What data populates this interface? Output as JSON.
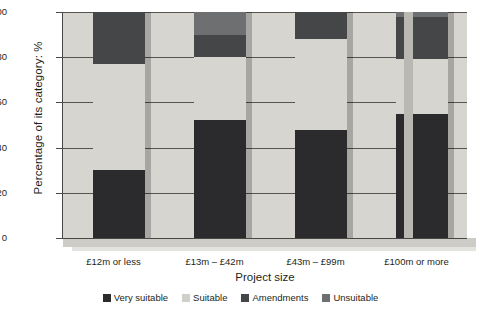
{
  "chart_data": {
    "type": "bar",
    "subtype": "stacked-100-percent",
    "title": "",
    "xlabel": "Project size",
    "ylabel": "Percentage of its category: %",
    "ylim": [
      0,
      100
    ],
    "yticks": [
      0,
      20,
      40,
      60,
      80,
      100
    ],
    "ytick_labels": [
      "0",
      "20",
      "40",
      "60",
      "80",
      "100"
    ],
    "grid": true,
    "legend_position": "bottom",
    "categories": [
      "£12m or less",
      "£13m – £42m",
      "£43m – £99m",
      "£100m or more"
    ],
    "series": [
      {
        "name": "Very suitable",
        "color": "#2b2b2d",
        "values": [
          30,
          52,
          48,
          55
        ]
      },
      {
        "name": "Suitable",
        "color": "#d6d5d0",
        "values": [
          47,
          28,
          40,
          24
        ]
      },
      {
        "name": "Amendments",
        "color": "#454648",
        "values": [
          23,
          10,
          12,
          19
        ]
      },
      {
        "name": "Unsuitable",
        "color": "#6e6f71",
        "values": [
          0,
          10,
          0,
          2
        ]
      }
    ]
  },
  "axes": {
    "y_title": "Percentage of its category: %",
    "x_title": "Project size",
    "y_ticks": [
      "100",
      "80",
      "60",
      "40",
      "20",
      "0"
    ],
    "x_labels": [
      "£12m or less",
      "£13m – £42m",
      "£43m – £99m",
      "£100m or more"
    ]
  },
  "legend": {
    "items": [
      {
        "label": "Very suitable",
        "color": "#2b2b2d"
      },
      {
        "label": "Suitable",
        "color": "#d0cfca"
      },
      {
        "label": "Amendments",
        "color": "#454648"
      },
      {
        "label": "Unsuitable",
        "color": "#6e6f71"
      }
    ]
  },
  "colors": {
    "plot_background": "#d6d5d0",
    "wall_side": "#b9b8b3",
    "gridline": "#565451",
    "axis": "#4a4844",
    "text": "#231f20",
    "page_background": "#ffffff"
  }
}
